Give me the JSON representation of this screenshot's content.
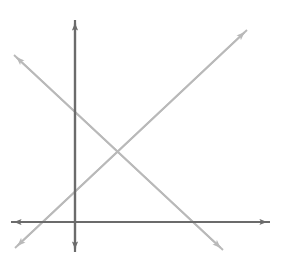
{
  "figure": {
    "width": 281,
    "height": 268,
    "background_color": "#ffffff"
  },
  "colors": {
    "axis": "#6b6b6b",
    "line": "#b9b9b9"
  },
  "chart_data": {
    "type": "line",
    "title": "",
    "subtitle": "",
    "xlabel": "",
    "ylabel": "",
    "grid": false,
    "legend": null,
    "axes": {
      "origin_px": [
        74,
        222
      ],
      "x_axis": {
        "name": "x-axis",
        "from_px": [
          11,
          222
        ],
        "to_px": [
          270,
          222
        ],
        "arrows": "both",
        "tick_labels": [],
        "xlim": [
          -0.9,
          2.8
        ]
      },
      "y_axis": {
        "name": "y-axis",
        "from_px": [
          75,
          252
        ],
        "to_px": [
          75,
          20
        ],
        "arrows": "both",
        "tick_labels": [],
        "ylim": [
          -0.4,
          2.9
        ]
      },
      "units_per_px": 70
    },
    "series": [
      {
        "name": "decreasing-line",
        "description": "Line with negative slope falling left to right",
        "slope": -0.93,
        "y_intercept_px": [
          75,
          113
        ],
        "x_intercept_px": [
          192,
          222
        ],
        "start_px": [
          14,
          55
        ],
        "end_px": [
          223,
          250
        ],
        "arrows": "both",
        "color": "#b9b9b9",
        "points": [
          [
            14,
            55
          ],
          [
            75,
            113
          ],
          [
            122,
            150
          ],
          [
            192,
            222
          ],
          [
            223,
            250
          ]
        ]
      },
      {
        "name": "increasing-line",
        "description": "Line with positive slope rising left to right",
        "slope": 0.94,
        "y_intercept_px": [
          75,
          190
        ],
        "x_intercept_px": [
          41,
          222
        ],
        "start_px": [
          15,
          248
        ],
        "end_px": [
          247,
          30
        ],
        "arrows": "both",
        "color": "#b9b9b9",
        "points": [
          [
            15,
            248
          ],
          [
            41,
            222
          ],
          [
            75,
            190
          ],
          [
            122,
            150
          ],
          [
            247,
            30
          ]
        ]
      }
    ],
    "intersection_px": [
      122,
      150
    ],
    "annotations": []
  }
}
